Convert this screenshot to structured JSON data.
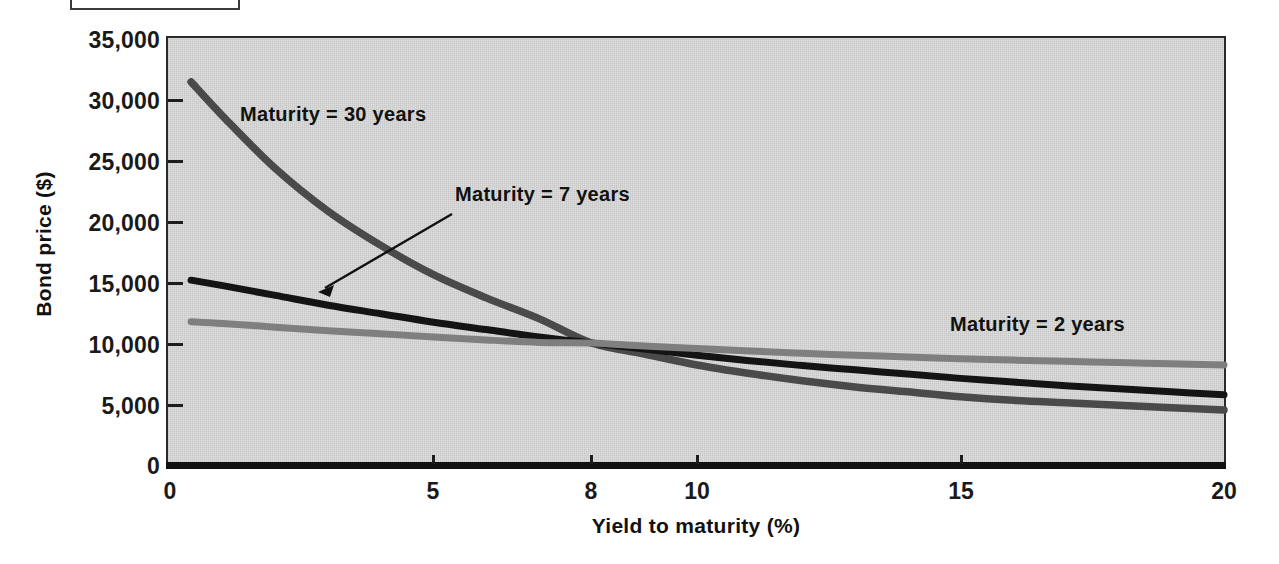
{
  "figure": {
    "label_box_text": ""
  },
  "chart_data": {
    "type": "line",
    "title": "",
    "xlabel": "Yield to maturity (%)",
    "ylabel": "Bond price ($)",
    "xlim": [
      0,
      20
    ],
    "ylim": [
      0,
      35000
    ],
    "xticks": [
      0,
      5,
      8,
      10,
      15,
      20
    ],
    "xticklabels": [
      "0",
      "5",
      "8",
      "10",
      "15",
      "20"
    ],
    "yticks": [
      0,
      5000,
      10000,
      15000,
      20000,
      25000,
      30000,
      35000
    ],
    "yticklabels": [
      "0",
      "5,000",
      "10,000",
      "15,000",
      "20,000",
      "25,000",
      "30,000",
      "35,000"
    ],
    "grid": false,
    "legend_position": "in-plot annotations",
    "plot_background": "#d2d2d2",
    "annotations": [
      {
        "text": "Maturity = 30 years",
        "series": "30-year",
        "has_arrow": false
      },
      {
        "text": "Maturity = 7 years",
        "series": "7-year",
        "has_arrow": true
      },
      {
        "text": "Maturity = 2 years",
        "series": "2-year",
        "has_arrow": false
      }
    ],
    "series": [
      {
        "name": "Maturity = 30 years",
        "color": "#4a4a4a",
        "x": [
          0.4,
          1,
          2,
          3,
          4,
          5,
          6,
          7,
          8,
          9,
          10,
          11,
          12,
          13,
          14,
          15,
          16,
          17,
          18,
          19,
          20
        ],
        "values": [
          31400,
          28600,
          24300,
          20800,
          18000,
          15600,
          13700,
          12000,
          10000,
          9100,
          8200,
          7500,
          6900,
          6400,
          6000,
          5600,
          5300,
          5100,
          4900,
          4700,
          4500
        ]
      },
      {
        "name": "Maturity = 7 years",
        "color": "#141414",
        "x": [
          0.4,
          1,
          2,
          3,
          4,
          5,
          6,
          7,
          8,
          9,
          10,
          11,
          12,
          13,
          14,
          15,
          16,
          17,
          18,
          19,
          20
        ],
        "values": [
          15150,
          14700,
          13900,
          13100,
          12400,
          11700,
          11100,
          10500,
          10000,
          9500,
          9000,
          8550,
          8150,
          7800,
          7450,
          7100,
          6800,
          6500,
          6250,
          6000,
          5750
        ]
      },
      {
        "name": "Maturity = 2 years",
        "color": "#7f7f7f",
        "x": [
          0.4,
          1,
          2,
          3,
          4,
          5,
          6,
          7,
          8,
          9,
          10,
          11,
          12,
          13,
          14,
          15,
          16,
          17,
          18,
          19,
          20
        ],
        "values": [
          11750,
          11600,
          11300,
          11000,
          10750,
          10500,
          10250,
          10050,
          10000,
          9750,
          9550,
          9350,
          9150,
          9000,
          8850,
          8700,
          8600,
          8500,
          8400,
          8300,
          8200
        ]
      }
    ]
  }
}
